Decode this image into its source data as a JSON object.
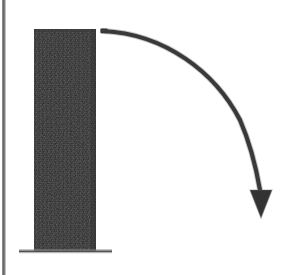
{
  "figure": {
    "title": "Toppling bar diagram",
    "description": "A tall dark vertical bar resting on a thin ground line, with a curved arrow sweeping from the bar's top-right corner down and to the right, indicating the direction of fall.",
    "background_color": "#ffffff",
    "canvas": {
      "width": 284,
      "height": 275
    }
  },
  "elements": {
    "left_border": {
      "name": "left vertical rule",
      "color": "#4a4a4a",
      "x": 3,
      "y_start": 0,
      "y_end": 275,
      "thickness": 2
    },
    "bar": {
      "name": "vertical bar",
      "fill_color": "#2e2e2e",
      "texture": "dithered-halftone",
      "x": 34,
      "y": 29,
      "width": 62,
      "height": 222
    },
    "ground_line": {
      "name": "ground base line",
      "color": "#555555",
      "x_start": 19,
      "x_end": 112,
      "y": 251,
      "thickness": 2
    },
    "arrow": {
      "name": "curved motion arrow",
      "color": "#3a3a3a",
      "stroke_width": 4,
      "start_x": 103,
      "start_y": 31,
      "end_x": 261,
      "end_y": 190,
      "tip_x": 261,
      "tip_y": 218,
      "head_half_width": 11,
      "direction": "clockwise-down-right"
    }
  },
  "colors": {
    "bar_dark": "#2e2e2e",
    "arrow_gray": "#3a3a3a",
    "rule_gray": "#4a4a4a",
    "ground_gray": "#555555",
    "paper_white": "#ffffff"
  },
  "labels": {
    "bar_label": "",
    "arrow_label": "",
    "ground_label": ""
  }
}
